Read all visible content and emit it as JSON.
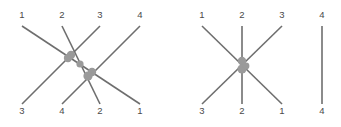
{
  "figure": {
    "background_color": "#ffffff",
    "strand_color": "#6e6e6e",
    "crossing_dot_color": "#9a9a9a",
    "label_color": "#4a4a4a"
  },
  "panels": [
    {
      "id": "left",
      "name": "left-braid-diagram",
      "top_labels": [
        "1",
        "2",
        "3",
        "4"
      ],
      "bottom_labels": [
        "3",
        "4",
        "2",
        "1"
      ],
      "top_label_x": [
        22,
        62,
        100,
        140
      ],
      "bottom_label_x": [
        22,
        62,
        100,
        140
      ],
      "top_label_y": 18,
      "bottom_label_y": 114,
      "strand_top_y": 26,
      "strand_bottom_y": 104,
      "strands": [
        {
          "name": "strand-1-to-1",
          "x1": 22,
          "y1": 26,
          "x2": 140,
          "y2": 104
        },
        {
          "name": "strand-2-to-2",
          "x1": 62,
          "y1": 26,
          "x2": 100,
          "y2": 104
        },
        {
          "name": "strand-3-to-3",
          "x1": 100,
          "y1": 26,
          "x2": 22,
          "y2": 104
        },
        {
          "name": "strand-4-to-4",
          "x1": 140,
          "y1": 26,
          "x2": 62,
          "y2": 104
        }
      ],
      "crossings": [
        {
          "name": "crossing-a",
          "cx": 71,
          "cy": 55,
          "r": 4.2
        },
        {
          "name": "crossing-b",
          "cx": 68,
          "cy": 58,
          "r": 4.2
        },
        {
          "name": "crossing-c",
          "cx": 80,
          "cy": 64,
          "r": 3.6
        },
        {
          "name": "crossing-d",
          "cx": 92,
          "cy": 72,
          "r": 4.2
        },
        {
          "name": "crossing-e",
          "cx": 88,
          "cy": 76,
          "r": 4.6
        }
      ]
    },
    {
      "id": "right",
      "name": "right-braid-diagram",
      "top_labels": [
        "1",
        "2",
        "3",
        "4"
      ],
      "bottom_labels": [
        "3",
        "2",
        "1",
        "4"
      ],
      "top_label_x": [
        32,
        72,
        112,
        152
      ],
      "bottom_label_x": [
        32,
        72,
        112,
        152
      ],
      "top_label_y": 18,
      "bottom_label_y": 114,
      "strand_top_y": 26,
      "strand_bottom_y": 104,
      "strands": [
        {
          "name": "strand-1-to-1",
          "x1": 32,
          "y1": 26,
          "x2": 112,
          "y2": 104
        },
        {
          "name": "strand-2-to-2",
          "x1": 72,
          "y1": 26,
          "x2": 72,
          "y2": 104
        },
        {
          "name": "strand-3-to-3",
          "x1": 112,
          "y1": 26,
          "x2": 32,
          "y2": 104
        },
        {
          "name": "strand-4-to-4",
          "x1": 152,
          "y1": 26,
          "x2": 152,
          "y2": 104
        }
      ],
      "crossings": [
        {
          "name": "crossing-a",
          "cx": 72,
          "cy": 61,
          "r": 4.2
        },
        {
          "name": "crossing-b",
          "cx": 72,
          "cy": 69,
          "r": 4.6
        },
        {
          "name": "crossing-c",
          "cx": 76,
          "cy": 66,
          "r": 3.4
        }
      ]
    }
  ]
}
